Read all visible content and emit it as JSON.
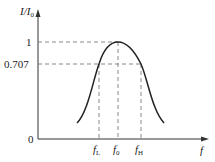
{
  "diagram": {
    "y_axis": {
      "label": "I/I",
      "label_sub": "0"
    },
    "x_axis": {
      "label": "f"
    },
    "origin": "0",
    "y_ticks": [
      {
        "label": "1",
        "value": 1
      },
      {
        "label": "0.707",
        "value": 0.707
      }
    ],
    "x_ticks": [
      {
        "label": "f",
        "sub": "L"
      },
      {
        "label": "f",
        "sub": "0"
      },
      {
        "label": "f",
        "sub": "H"
      }
    ],
    "colors": {
      "curve": "#222222",
      "axis": "#222222",
      "dashed": "#888888"
    }
  }
}
